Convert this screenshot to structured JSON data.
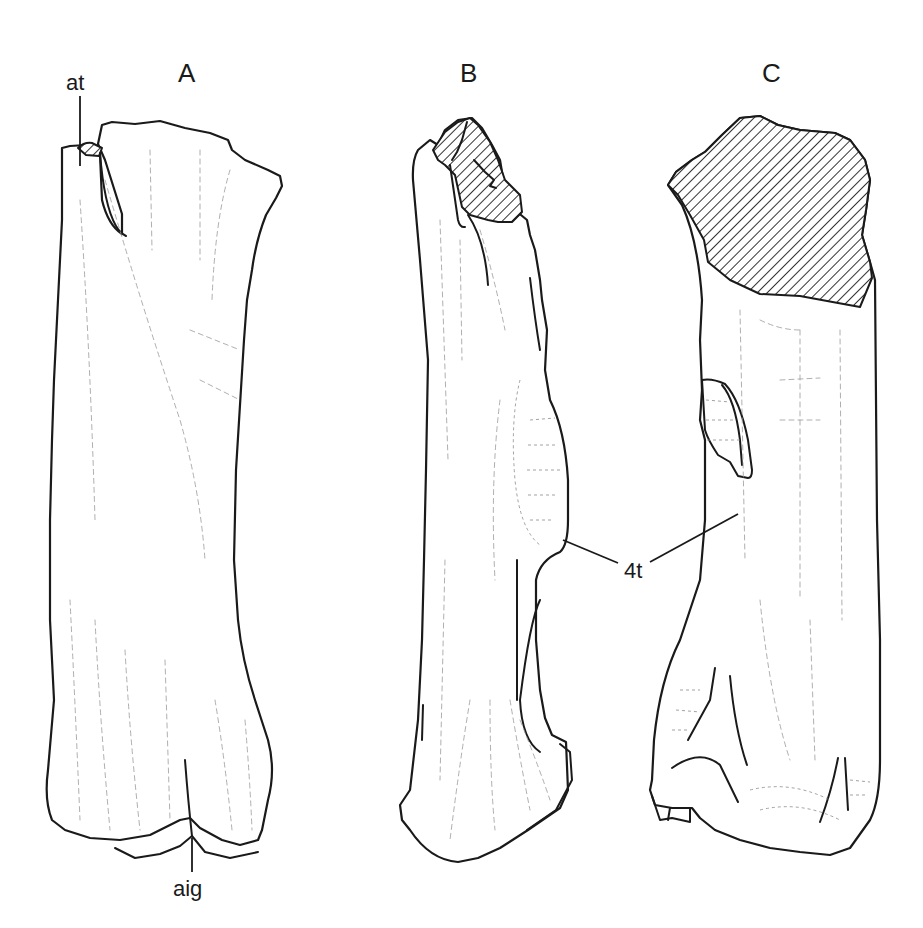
{
  "figure": {
    "panels": [
      {
        "id": "A",
        "label": "A"
      },
      {
        "id": "B",
        "label": "B"
      },
      {
        "id": "C",
        "label": "C"
      }
    ],
    "annotations": {
      "at": "at",
      "aig": "aig",
      "fourth_trochanter": "4t"
    },
    "colors": {
      "line": "#1a1a1a",
      "texture": "#9a9a9a",
      "background": "#ffffff"
    }
  }
}
